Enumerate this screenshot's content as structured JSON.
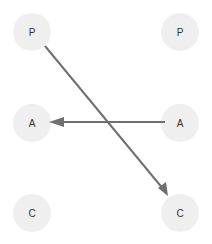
{
  "diagram": {
    "type": "matching",
    "columns": [
      {
        "name": "left",
        "nodes": [
          {
            "id": "L1",
            "label": "P",
            "cx": 32,
            "cy": 32
          },
          {
            "id": "L2",
            "label": "A",
            "cx": 32,
            "cy": 123
          },
          {
            "id": "L3",
            "label": "C",
            "cx": 32,
            "cy": 213
          }
        ]
      },
      {
        "name": "right",
        "nodes": [
          {
            "id": "R1",
            "label": "P",
            "cx": 180,
            "cy": 32
          },
          {
            "id": "R2",
            "label": "A",
            "cx": 180,
            "cy": 123
          },
          {
            "id": "R3",
            "label": "C",
            "cx": 180,
            "cy": 213
          }
        ]
      }
    ],
    "edges": [
      {
        "from": "L1",
        "to": "R3",
        "directed": true
      },
      {
        "from": "R2",
        "to": "L2",
        "directed": true
      }
    ],
    "colors": {
      "node_fill": "#efefef",
      "edge": "#707070",
      "label": "#333333",
      "background": "#ffffff"
    }
  }
}
